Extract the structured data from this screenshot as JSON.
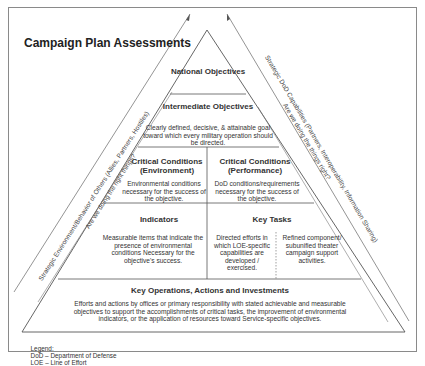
{
  "title": "Campaign Plan Assessments",
  "pyramid": {
    "national": {
      "heading": "National Objectives"
    },
    "intermediate": {
      "heading": "Intermediate Objectives",
      "body": "Clearly defined, decisive, & attainable goal toward which every military operation should be directed."
    },
    "critical_environment": {
      "heading": "Critical Conditions (Environment)",
      "body": "Environmental conditions necessary for the success of the objective."
    },
    "critical_performance": {
      "heading": "Critical Conditions (Performance)",
      "body": "DoD conditions/requirements necessary for the success of the objective."
    },
    "indicators": {
      "heading": "Indicators",
      "body": "Measurable items that indicate the presence of environmental conditions Necessary for the objective's success."
    },
    "key_tasks": {
      "heading": "Key Tasks",
      "body_left": "Directed efforts in which LOE-specific capabilities are developed / exercised.",
      "body_right": "Refined component/ subunified theater campaign support activities."
    },
    "key_operations": {
      "heading": "Key Operations, Actions and Investments",
      "body": "Efforts and actions by offices or primary responsibility with stated achievable and measurable objectives to support the accomplishments of critical tasks, the improvement of environmental indicators, or the application of resources toward Service-specific objectives."
    }
  },
  "side_labels": {
    "left_outer": "Strategic Environment/Behavior of Others (Allies, Partners, Hostiles)",
    "left_inner": "Are we doing the right things?",
    "right_outer": "Strategic DoD Capabilities (Partners, Interoperability, Information Sharing)",
    "right_inner": "Are we doing the things right?"
  },
  "legend": {
    "label": "Legend:",
    "items": [
      "DoD – Department of Defense",
      "LOE – Line of Effort"
    ]
  },
  "colors": {
    "line": "#555555",
    "frame": "#8a8a8a",
    "text": "#333333"
  }
}
